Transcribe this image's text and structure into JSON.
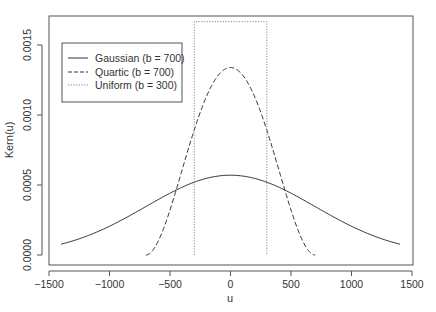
{
  "chart_data": {
    "type": "line",
    "title": "",
    "xlabel": "u",
    "ylabel": "Kern(u)",
    "xlim": [
      -1500,
      1500
    ],
    "ylim": [
      0,
      0.0015
    ],
    "x_ticks": [
      -1500,
      -1000,
      -500,
      0,
      500,
      1000,
      1500
    ],
    "x_tick_labels": [
      "−1500",
      "−1000",
      "−500",
      "0",
      "500",
      "1000",
      "1500"
    ],
    "y_ticks": [
      0,
      0.0005,
      0.001,
      0.0015
    ],
    "y_tick_labels": [
      "0.0000",
      "0.0005",
      "0.0010",
      "0.0015"
    ],
    "grid": false,
    "legend_position": "top-left",
    "series": [
      {
        "name": "Gaussian (b = 700)",
        "kernel": "gaussian",
        "bandwidth": 700,
        "x_range": [
          -1400,
          1400
        ],
        "line_style": "solid",
        "peak": 0.00057
      },
      {
        "name": "Quartic (b = 700)",
        "kernel": "quartic",
        "bandwidth": 700,
        "x_range": [
          -700,
          700
        ],
        "line_style": "dashed",
        "peak": 0.00134
      },
      {
        "name": "Uniform (b = 300)",
        "kernel": "uniform",
        "bandwidth": 300,
        "x_range": [
          -300,
          300
        ],
        "line_style": "dotted",
        "peak": 0.00167
      }
    ]
  },
  "colors": {
    "line": "#333333",
    "axis": "#555555",
    "uniform": "#888888"
  }
}
